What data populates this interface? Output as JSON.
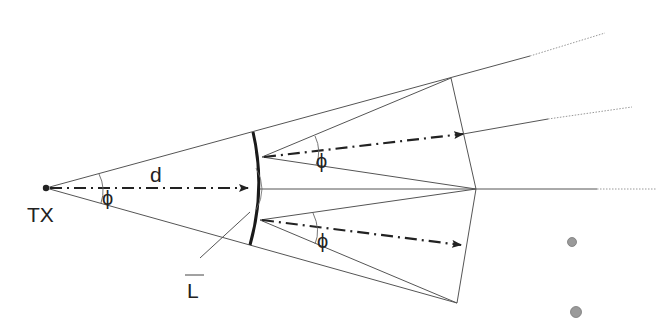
{
  "labels": {
    "transmitter": "TX",
    "distance": "d",
    "angle_center": "ϕ",
    "angle_upper": "ϕ",
    "angle_lower": "ϕ",
    "lens": "L"
  },
  "colors": {
    "line": "#555555",
    "beam": "#222222",
    "lens": "#1a1a1a",
    "dot_fill": "#9a9a9a",
    "dot_stroke": "#777777",
    "dotted": "#999999"
  }
}
